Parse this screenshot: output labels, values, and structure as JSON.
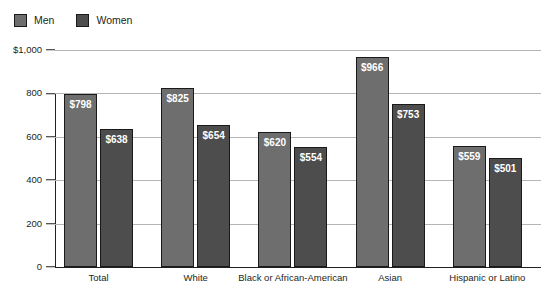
{
  "legend": {
    "position": "top-left",
    "entries": [
      {
        "label": "Men",
        "icon": "legend-swatch-men",
        "color": "#6e6e6e"
      },
      {
        "label": "Women",
        "icon": "legend-swatch-women",
        "color": "#4d4d4d"
      }
    ]
  },
  "chart_data": {
    "type": "bar",
    "title": "",
    "subtitle": "",
    "xlabel": "",
    "ylabel": "",
    "ylim": [
      0,
      1000
    ],
    "grid": true,
    "legend_position": "top-left",
    "categories": [
      "Total",
      "White",
      "Black or African-American",
      "Asian",
      "Hispanic or Latino"
    ],
    "series": [
      {
        "name": "Men",
        "color": "#6e6e6e",
        "values": [
          798,
          825,
          620,
          966,
          559
        ],
        "labels": [
          "$798",
          "$825",
          "$620",
          "$966",
          "$559"
        ]
      },
      {
        "name": "Women",
        "color": "#4d4d4d",
        "values": [
          638,
          654,
          554,
          753,
          501
        ],
        "labels": [
          "$638",
          "$654",
          "$554",
          "$753",
          "$501"
        ]
      }
    ],
    "yticks": [
      0,
      200,
      400,
      600,
      800,
      1000
    ],
    "ytick_labels": [
      "0",
      "200",
      "400",
      "600",
      "800",
      "$1,000"
    ]
  }
}
